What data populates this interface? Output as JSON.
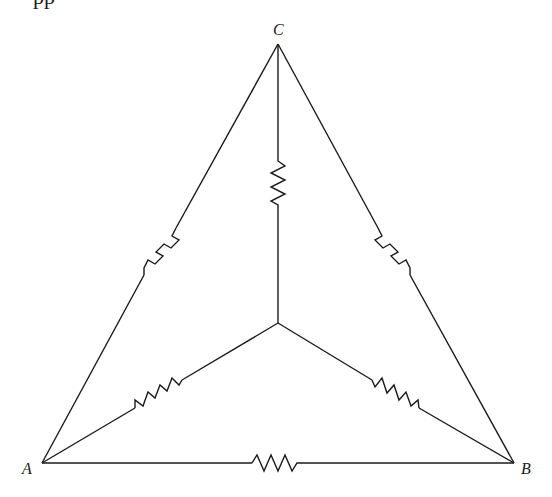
{
  "diagram": {
    "type": "circuit",
    "cut_off_text_top": "pp",
    "nodes": {
      "A": {
        "label": "A",
        "x": 42,
        "y": 463
      },
      "B": {
        "label": "B",
        "x": 514,
        "y": 463
      },
      "C": {
        "label": "C",
        "x": 278,
        "y": 44
      },
      "O": {
        "label": "",
        "x": 278,
        "y": 323
      }
    },
    "labels": {
      "A": "A",
      "B": "B",
      "C": "C"
    },
    "edges": [
      {
        "name": "delta-CA",
        "from": "C",
        "to": "A",
        "has_resistor": true
      },
      {
        "name": "delta-CB",
        "from": "C",
        "to": "B",
        "has_resistor": true
      },
      {
        "name": "delta-AB",
        "from": "A",
        "to": "B",
        "has_resistor": true
      },
      {
        "name": "wye-CO",
        "from": "C",
        "to": "O",
        "has_resistor": true
      },
      {
        "name": "wye-AO",
        "from": "A",
        "to": "O",
        "has_resistor": true
      },
      {
        "name": "wye-BO",
        "from": "B",
        "to": "O",
        "has_resistor": true
      }
    ],
    "resistor_count": 6,
    "colors": {
      "line": "#1a1a1a",
      "background": "#ffffff"
    }
  }
}
